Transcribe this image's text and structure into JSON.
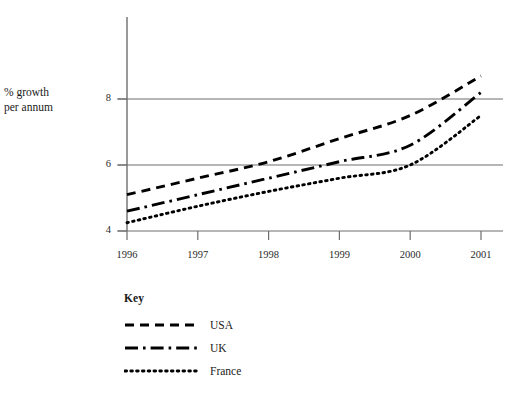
{
  "chart_data": {
    "type": "line",
    "title": "",
    "xlabel": "",
    "ylabel": "% growth per annum",
    "x": [
      1996,
      1997,
      1998,
      1999,
      2000,
      2001
    ],
    "xtick_labels": [
      "1996",
      "1997",
      "1998",
      "1999",
      "2000",
      "2001"
    ],
    "ytick_labels": [
      "4",
      "6",
      "8"
    ],
    "ytick_values": [
      4,
      6,
      8
    ],
    "xlim": [
      1996,
      2001
    ],
    "ylim": [
      4,
      9
    ],
    "grid": "horizontal",
    "legend_position": "below-plot-left",
    "legend_title": "Key",
    "series": [
      {
        "name": "USA",
        "dash": "dashed",
        "color": "#000000",
        "values": [
          5.1,
          5.6,
          6.1,
          6.8,
          7.5,
          8.7
        ]
      },
      {
        "name": "UK",
        "dash": "dash-dot",
        "color": "#000000",
        "values": [
          4.6,
          5.1,
          5.6,
          6.1,
          6.6,
          8.2
        ]
      },
      {
        "name": "France",
        "dash": "dotted",
        "color": "#000000",
        "values": [
          4.25,
          4.75,
          5.2,
          5.6,
          6.0,
          7.5
        ]
      }
    ]
  },
  "axis": {
    "y_title_line1": "% growth",
    "y_title_line2": "per annum"
  },
  "legend": {
    "title": "Key",
    "items": [
      {
        "label": "USA"
      },
      {
        "label": "UK"
      },
      {
        "label": "France"
      }
    ]
  },
  "colors": {
    "ink": "#000000",
    "axis": "#6e6e6e",
    "grid": "#6e6e6e",
    "text": "#1a1a1a"
  }
}
